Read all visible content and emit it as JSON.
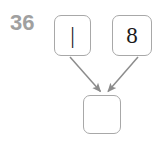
{
  "diagram": {
    "index_label": "36",
    "background_color": "#ffffff",
    "node_border_color": "#a8a8a8",
    "node_fill_color": "#ffffff",
    "edge_color": "#8c8c8c",
    "label_color": "#a0a0a0",
    "digit_color": "#1a1a1a",
    "nodes": [
      {
        "id": "top-left",
        "label": "|",
        "x": 54,
        "y": 15,
        "w": 37,
        "h": 41
      },
      {
        "id": "top-right",
        "label": "8",
        "x": 112,
        "y": 15,
        "w": 40,
        "h": 41
      },
      {
        "id": "bottom",
        "label": "",
        "x": 83,
        "y": 95,
        "w": 38,
        "h": 39
      }
    ],
    "edges": [
      {
        "id": "edge-left-to-bottom",
        "from": "top-left",
        "to": "bottom",
        "arrowhead": true
      },
      {
        "id": "edge-right-to-bottom",
        "from": "top-right",
        "to": "bottom",
        "arrowhead": true
      }
    ]
  }
}
